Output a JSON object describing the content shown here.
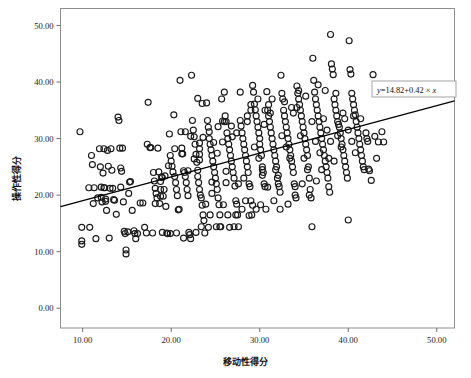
{
  "figure": {
    "background": "#ffffff",
    "frame_color": "#808080",
    "marker_color": "#1a1a1a",
    "line_color": "#000000"
  },
  "annotation": {
    "equation_label": "y=14.82+0.42 × x",
    "equation_parts": {
      "y": "y",
      "rest": "=14.82+0.42 × ",
      "x": "x"
    },
    "box_border": "#9a9a9a"
  },
  "chart_data": {
    "type": "scatter",
    "title": "",
    "xlabel": "移动性得分",
    "ylabel": "操作性得分",
    "xlim": [
      7.5,
      52.0
    ],
    "ylim": [
      -3.5,
      53.0
    ],
    "xticks": [
      10,
      20,
      30,
      40,
      50
    ],
    "yticks": [
      0,
      10,
      20,
      30,
      40,
      50
    ],
    "xticklabels": [
      "10.00",
      "20.00",
      "30.00",
      "40.00",
      "50.00"
    ],
    "yticklabels": [
      "0.00",
      "10.00",
      "20.00",
      "30.00",
      "40.00",
      "50.00"
    ],
    "grid": false,
    "legend": false,
    "marker": "open-circle",
    "marker_size": 3.0,
    "fit_line": {
      "label": "y=14.82+0.42 × x",
      "intercept": 14.82,
      "slope": 0.42,
      "x_start": 7.5,
      "x_end": 52.0
    },
    "points": [
      [
        9.7,
        31.2
      ],
      [
        9.9,
        14.3
      ],
      [
        9.9,
        11.9
      ],
      [
        9.9,
        11.3
      ],
      [
        10.7,
        21.3
      ],
      [
        10.8,
        14.3
      ],
      [
        11.0,
        27.0
      ],
      [
        11.1,
        25.4
      ],
      [
        11.2,
        18.5
      ],
      [
        11.3,
        21.3
      ],
      [
        11.5,
        12.3
      ],
      [
        11.9,
        28.2
      ],
      [
        12.0,
        25.0
      ],
      [
        12.1,
        21.4
      ],
      [
        12.1,
        19.6
      ],
      [
        12.2,
        18.8
      ],
      [
        12.3,
        23.9
      ],
      [
        12.4,
        28.2
      ],
      [
        12.5,
        21.3
      ],
      [
        12.6,
        19.3
      ],
      [
        12.7,
        17.3
      ],
      [
        12.8,
        27.9
      ],
      [
        12.9,
        25.1
      ],
      [
        13.0,
        12.4
      ],
      [
        13.2,
        28.2
      ],
      [
        13.3,
        24.4
      ],
      [
        13.4,
        21.2
      ],
      [
        13.6,
        19.1
      ],
      [
        13.8,
        16.6
      ],
      [
        14.0,
        33.8
      ],
      [
        14.1,
        33.2
      ],
      [
        14.2,
        28.3
      ],
      [
        14.3,
        24.8
      ],
      [
        14.4,
        24.2
      ],
      [
        14.6,
        18.8
      ],
      [
        14.7,
        13.6
      ],
      [
        14.8,
        13.2
      ],
      [
        14.9,
        10.3
      ],
      [
        14.9,
        9.6
      ],
      [
        15.2,
        20.3
      ],
      [
        15.4,
        22.4
      ],
      [
        15.6,
        17.3
      ],
      [
        15.8,
        13.7
      ],
      [
        15.9,
        13.2
      ],
      [
        16.0,
        12.3
      ],
      [
        16.5,
        18.6
      ],
      [
        17.0,
        14.3
      ],
      [
        17.3,
        29.0
      ],
      [
        17.4,
        36.4
      ],
      [
        17.6,
        28.4
      ],
      [
        17.9,
        13.3
      ],
      [
        18.0,
        24.0
      ],
      [
        18.1,
        22.5
      ],
      [
        18.2,
        21.2
      ],
      [
        18.3,
        20.3
      ],
      [
        18.4,
        19.5
      ],
      [
        18.5,
        28.3
      ],
      [
        18.6,
        24.1
      ],
      [
        18.7,
        18.5
      ],
      [
        18.9,
        23.2
      ],
      [
        19.0,
        23.1
      ],
      [
        19.2,
        21.0
      ],
      [
        19.4,
        18.0
      ],
      [
        19.5,
        13.3
      ],
      [
        19.6,
        13.2
      ],
      [
        19.8,
        30.8
      ],
      [
        19.9,
        27.0
      ],
      [
        20.0,
        26.0
      ],
      [
        20.1,
        25.1
      ],
      [
        20.2,
        24.1
      ],
      [
        20.3,
        34.2
      ],
      [
        20.4,
        23.3
      ],
      [
        20.5,
        22.2
      ],
      [
        20.6,
        21.0
      ],
      [
        20.7,
        19.9
      ],
      [
        20.8,
        17.4
      ],
      [
        21.0,
        40.3
      ],
      [
        21.1,
        31.2
      ],
      [
        21.3,
        27.3
      ],
      [
        21.4,
        24.3
      ],
      [
        21.5,
        24.0
      ],
      [
        21.6,
        23.3
      ],
      [
        21.7,
        22.2
      ],
      [
        21.8,
        21.0
      ],
      [
        21.9,
        19.9
      ],
      [
        22.0,
        13.4
      ],
      [
        22.1,
        13.0
      ],
      [
        22.2,
        12.3
      ],
      [
        22.3,
        41.2
      ],
      [
        22.4,
        33.2
      ],
      [
        22.5,
        31.5
      ],
      [
        22.6,
        30.3
      ],
      [
        22.7,
        29.0
      ],
      [
        22.8,
        27.2
      ],
      [
        22.9,
        25.8
      ],
      [
        23.0,
        24.4
      ],
      [
        23.0,
        23.3
      ],
      [
        23.1,
        22.2
      ],
      [
        23.2,
        21.0
      ],
      [
        23.3,
        20.0
      ],
      [
        23.4,
        19.5
      ],
      [
        23.5,
        18.2
      ],
      [
        23.6,
        16.5
      ],
      [
        23.7,
        15.5
      ],
      [
        23.8,
        13.3
      ],
      [
        24.0,
        36.3
      ],
      [
        24.1,
        33.2
      ],
      [
        24.2,
        32.0
      ],
      [
        24.3,
        30.0
      ],
      [
        24.4,
        29.0
      ],
      [
        24.5,
        28.0
      ],
      [
        24.6,
        27.0
      ],
      [
        24.7,
        26.0
      ],
      [
        24.8,
        25.0
      ],
      [
        24.9,
        24.0
      ],
      [
        25.0,
        23.0
      ],
      [
        25.1,
        22.0
      ],
      [
        25.2,
        21.0
      ],
      [
        25.3,
        19.5
      ],
      [
        25.4,
        18.3
      ],
      [
        25.5,
        16.5
      ],
      [
        25.6,
        14.4
      ],
      [
        25.7,
        37.0
      ],
      [
        25.8,
        33.1
      ],
      [
        26.0,
        38.2
      ],
      [
        26.1,
        34.0
      ],
      [
        26.2,
        33.0
      ],
      [
        26.3,
        31.0
      ],
      [
        26.4,
        30.0
      ],
      [
        26.5,
        29.0
      ],
      [
        26.6,
        28.0
      ],
      [
        26.7,
        27.0
      ],
      [
        26.8,
        26.0
      ],
      [
        26.9,
        25.0
      ],
      [
        27.0,
        24.0
      ],
      [
        27.1,
        23.0
      ],
      [
        27.2,
        21.6
      ],
      [
        27.3,
        19.0
      ],
      [
        27.4,
        18.4
      ],
      [
        27.5,
        16.5
      ],
      [
        27.6,
        14.4
      ],
      [
        27.8,
        38.2
      ],
      [
        27.9,
        32.2
      ],
      [
        28.0,
        31.0
      ],
      [
        28.1,
        30.0
      ],
      [
        28.2,
        29.0
      ],
      [
        28.3,
        28.0
      ],
      [
        28.4,
        27.0
      ],
      [
        28.5,
        26.0
      ],
      [
        28.6,
        25.0
      ],
      [
        28.7,
        24.0
      ],
      [
        28.8,
        22.0
      ],
      [
        28.9,
        21.5
      ],
      [
        29.0,
        19.0
      ],
      [
        29.1,
        16.5
      ],
      [
        29.2,
        39.4
      ],
      [
        29.3,
        38.2
      ],
      [
        29.4,
        36.1
      ],
      [
        29.5,
        35.1
      ],
      [
        29.6,
        34.0
      ],
      [
        29.7,
        33.0
      ],
      [
        29.8,
        32.0
      ],
      [
        29.9,
        31.0
      ],
      [
        30.0,
        30.0
      ],
      [
        30.0,
        29.0
      ],
      [
        30.1,
        28.0
      ],
      [
        30.2,
        27.0
      ],
      [
        30.3,
        25.0
      ],
      [
        30.4,
        24.0
      ],
      [
        30.5,
        22.0
      ],
      [
        30.6,
        21.5
      ],
      [
        30.7,
        17.5
      ],
      [
        30.8,
        38.3
      ],
      [
        30.9,
        35.0
      ],
      [
        31.0,
        34.0
      ],
      [
        31.1,
        33.0
      ],
      [
        31.2,
        32.0
      ],
      [
        31.3,
        31.0
      ],
      [
        31.4,
        30.0
      ],
      [
        31.5,
        29.0
      ],
      [
        31.6,
        28.0
      ],
      [
        31.7,
        27.0
      ],
      [
        31.8,
        26.0
      ],
      [
        31.9,
        25.0
      ],
      [
        32.0,
        23.0
      ],
      [
        32.1,
        22.0
      ],
      [
        32.2,
        21.5
      ],
      [
        32.3,
        17.5
      ],
      [
        32.4,
        41.2
      ],
      [
        32.5,
        38.0
      ],
      [
        32.6,
        37.0
      ],
      [
        32.7,
        35.0
      ],
      [
        32.8,
        34.0
      ],
      [
        32.9,
        33.0
      ],
      [
        33.0,
        32.0
      ],
      [
        33.1,
        31.0
      ],
      [
        33.2,
        30.0
      ],
      [
        33.3,
        29.0
      ],
      [
        33.4,
        28.0
      ],
      [
        33.5,
        27.0
      ],
      [
        33.6,
        26.0
      ],
      [
        33.7,
        25.0
      ],
      [
        33.8,
        24.0
      ],
      [
        33.9,
        22.0
      ],
      [
        34.0,
        21.5
      ],
      [
        34.1,
        19.5
      ],
      [
        34.2,
        39.3
      ],
      [
        34.3,
        38.0
      ],
      [
        34.4,
        37.0
      ],
      [
        34.5,
        36.0
      ],
      [
        34.6,
        35.0
      ],
      [
        34.7,
        34.0
      ],
      [
        34.8,
        33.0
      ],
      [
        34.9,
        32.0
      ],
      [
        35.0,
        31.0
      ],
      [
        35.1,
        30.0
      ],
      [
        35.2,
        29.0
      ],
      [
        35.3,
        28.0
      ],
      [
        35.4,
        27.0
      ],
      [
        35.5,
        25.0
      ],
      [
        35.6,
        23.0
      ],
      [
        35.7,
        21.0
      ],
      [
        35.8,
        19.5
      ],
      [
        35.9,
        14.4
      ],
      [
        36.0,
        44.2
      ],
      [
        36.1,
        40.3
      ],
      [
        36.2,
        38.2
      ],
      [
        36.3,
        37.0
      ],
      [
        36.4,
        36.0
      ],
      [
        36.5,
        35.0
      ],
      [
        36.6,
        34.0
      ],
      [
        36.7,
        33.0
      ],
      [
        36.8,
        32.0
      ],
      [
        36.9,
        31.0
      ],
      [
        37.0,
        30.0
      ],
      [
        37.1,
        29.0
      ],
      [
        37.2,
        28.0
      ],
      [
        37.3,
        27.0
      ],
      [
        37.4,
        26.0
      ],
      [
        37.5,
        25.0
      ],
      [
        37.6,
        24.0
      ],
      [
        37.7,
        23.0
      ],
      [
        37.8,
        21.5
      ],
      [
        37.9,
        20.5
      ],
      [
        38.0,
        48.4
      ],
      [
        38.1,
        43.2
      ],
      [
        38.2,
        42.3
      ],
      [
        38.3,
        41.3
      ],
      [
        38.4,
        37.0
      ],
      [
        38.5,
        36.0
      ],
      [
        38.6,
        35.0
      ],
      [
        38.7,
        34.0
      ],
      [
        38.8,
        33.0
      ],
      [
        38.9,
        32.5
      ],
      [
        39.0,
        32.0
      ],
      [
        39.1,
        31.0
      ],
      [
        39.2,
        30.0
      ],
      [
        39.3,
        29.0
      ],
      [
        39.4,
        28.0
      ],
      [
        39.5,
        27.0
      ],
      [
        39.6,
        26.0
      ],
      [
        39.7,
        25.0
      ],
      [
        39.8,
        24.0
      ],
      [
        39.9,
        23.0
      ],
      [
        40.0,
        15.6
      ],
      [
        40.1,
        47.3
      ],
      [
        40.2,
        42.2
      ],
      [
        40.3,
        41.4
      ],
      [
        40.4,
        38.0
      ],
      [
        40.5,
        37.0
      ],
      [
        40.6,
        36.0
      ],
      [
        40.7,
        35.0
      ],
      [
        40.8,
        34.2
      ],
      [
        40.9,
        33.0
      ],
      [
        41.0,
        32.0
      ],
      [
        41.1,
        31.0
      ],
      [
        41.2,
        30.0
      ],
      [
        41.3,
        29.0
      ],
      [
        41.4,
        28.0
      ],
      [
        41.5,
        27.0
      ],
      [
        41.6,
        26.0
      ],
      [
        41.7,
        25.0
      ],
      [
        41.8,
        24.5
      ],
      [
        42.0,
        31.0
      ],
      [
        42.1,
        30.0
      ],
      [
        42.2,
        29.5
      ],
      [
        42.3,
        24.6
      ],
      [
        42.4,
        24.3
      ],
      [
        42.6,
        22.6
      ],
      [
        42.8,
        41.3
      ],
      [
        43.0,
        30.4
      ],
      [
        43.2,
        26.5
      ],
      [
        43.4,
        29.4
      ],
      [
        43.8,
        31.2
      ],
      [
        44.0,
        29.4
      ],
      [
        18.8,
        19.8
      ],
      [
        18.8,
        21.0
      ],
      [
        18.8,
        22.4
      ],
      [
        19.3,
        23.4
      ],
      [
        19.7,
        25.2
      ],
      [
        20.4,
        28.2
      ],
      [
        21.2,
        27.3
      ],
      [
        21.2,
        28.3
      ],
      [
        21.9,
        24.3
      ],
      [
        22.6,
        26.4
      ],
      [
        23.2,
        26.2
      ],
      [
        23.2,
        27.2
      ],
      [
        23.2,
        28.2
      ],
      [
        23.2,
        29.2
      ],
      [
        23.6,
        30.2
      ],
      [
        24.3,
        31.2
      ],
      [
        24.6,
        22.3
      ],
      [
        24.6,
        20.3
      ],
      [
        25.2,
        27.4
      ],
      [
        25.8,
        29.4
      ],
      [
        26.2,
        24.2
      ],
      [
        26.2,
        22.2
      ],
      [
        26.9,
        30.3
      ],
      [
        27.4,
        31.0
      ],
      [
        27.6,
        22.0
      ],
      [
        28.2,
        23.0
      ],
      [
        28.6,
        33.0
      ],
      [
        28.6,
        34.0
      ],
      [
        29.0,
        35.0
      ],
      [
        29.0,
        36.0
      ],
      [
        29.4,
        28.5
      ],
      [
        29.9,
        26.5
      ],
      [
        30.3,
        24.5
      ],
      [
        30.3,
        23.5
      ],
      [
        30.6,
        35.0
      ],
      [
        31.0,
        36.0
      ],
      [
        31.4,
        37.0
      ],
      [
        31.8,
        24.5
      ],
      [
        32.1,
        23.5
      ],
      [
        32.5,
        30.5
      ],
      [
        33.0,
        28.5
      ],
      [
        33.4,
        26.5
      ],
      [
        33.8,
        34.5
      ],
      [
        34.2,
        35.5
      ],
      [
        34.6,
        30.5
      ],
      [
        35.0,
        26.5
      ],
      [
        35.4,
        24.5
      ],
      [
        35.9,
        33.0
      ],
      [
        36.3,
        29.5
      ],
      [
        36.8,
        27.5
      ],
      [
        37.2,
        33.5
      ],
      [
        37.6,
        31.5
      ],
      [
        38.0,
        29.5
      ],
      [
        38.4,
        26.0
      ],
      [
        38.8,
        30.5
      ],
      [
        39.2,
        28.5
      ],
      [
        39.6,
        33.5
      ],
      [
        40.0,
        31.5
      ],
      [
        40.4,
        29.5
      ],
      [
        40.8,
        27.5
      ],
      [
        12.4,
        21.3
      ],
      [
        13.1,
        21.2
      ],
      [
        14.5,
        28.3
      ],
      [
        15.3,
        22.3
      ],
      [
        16.8,
        18.6
      ],
      [
        17.7,
        28.4
      ],
      [
        18.2,
        18.5
      ],
      [
        19.1,
        19.8
      ],
      [
        20.9,
        17.5
      ],
      [
        21.6,
        31.2
      ],
      [
        22.2,
        30.4
      ],
      [
        23.9,
        18.4
      ],
      [
        24.4,
        16.5
      ],
      [
        25.1,
        14.4
      ],
      [
        25.9,
        18.3
      ],
      [
        26.4,
        16.5
      ],
      [
        27.1,
        14.4
      ],
      [
        28.0,
        17.5
      ],
      [
        28.8,
        16.4
      ],
      [
        29.6,
        17.5
      ],
      [
        30.9,
        21.4
      ],
      [
        31.6,
        19.0
      ],
      [
        32.3,
        20.5
      ],
      [
        33.2,
        18.4
      ],
      [
        34.0,
        20.0
      ],
      [
        34.8,
        22.0
      ],
      [
        35.6,
        20.0
      ],
      [
        36.4,
        22.5
      ],
      [
        37.0,
        24.5
      ],
      [
        37.8,
        26.5
      ],
      [
        11.7,
        19.5
      ],
      [
        12.6,
        18.9
      ],
      [
        13.5,
        19.2
      ],
      [
        14.3,
        21.4
      ],
      [
        15.1,
        13.5
      ],
      [
        16.2,
        13.2
      ],
      [
        17.2,
        13.3
      ],
      [
        19.0,
        13.4
      ],
      [
        19.9,
        13.2
      ],
      [
        20.6,
        13.3
      ],
      [
        21.4,
        12.4
      ],
      [
        22.8,
        13.4
      ],
      [
        23.4,
        14.4
      ],
      [
        24.2,
        14.3
      ],
      [
        25.5,
        14.4
      ],
      [
        26.6,
        14.3
      ],
      [
        27.3,
        16.5
      ],
      [
        28.4,
        19.0
      ],
      [
        29.2,
        18.2
      ],
      [
        30.1,
        18.3
      ],
      [
        23.0,
        37.1
      ],
      [
        23.5,
        36.2
      ],
      [
        24.8,
        29.3
      ],
      [
        25.3,
        32.1
      ],
      [
        26.0,
        33.0
      ],
      [
        26.8,
        32.2
      ],
      [
        27.8,
        33.2
      ],
      [
        29.8,
        37.0
      ],
      [
        30.5,
        32.5
      ],
      [
        31.2,
        34.5
      ],
      [
        32.8,
        36.5
      ],
      [
        33.6,
        35.5
      ],
      [
        34.4,
        38.5
      ],
      [
        35.2,
        37.5
      ],
      [
        36.6,
        39.5
      ],
      [
        37.4,
        38.5
      ],
      [
        38.6,
        38.0
      ],
      [
        39.4,
        34.5
      ],
      [
        40.6,
        34.0
      ],
      [
        41.4,
        33.5
      ]
    ]
  }
}
